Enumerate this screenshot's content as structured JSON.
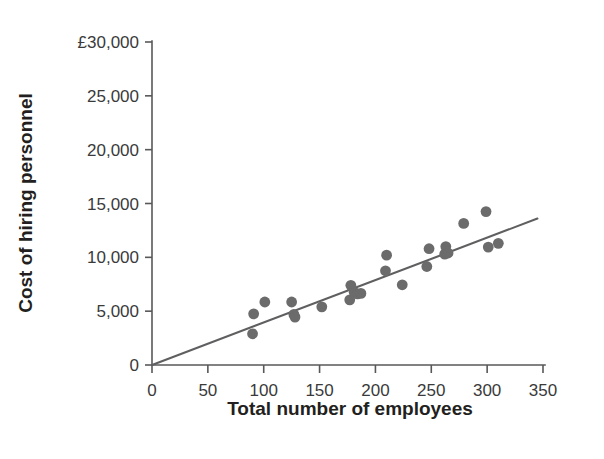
{
  "chart_data": {
    "type": "scatter",
    "title": "",
    "xlabel": "Total number of employees",
    "ylabel": "Cost of hiring personnel",
    "xlim": [
      0,
      350
    ],
    "ylim": [
      0,
      30000
    ],
    "grid": false,
    "legend": null,
    "currency_symbol": "£",
    "x_ticks": [
      0,
      50,
      100,
      150,
      200,
      250,
      300,
      350
    ],
    "x_tick_labels": [
      "0",
      "50",
      "100",
      "150",
      "200",
      "250",
      "300",
      "350"
    ],
    "y_ticks": [
      0,
      5000,
      10000,
      15000,
      20000,
      25000,
      30000
    ],
    "y_tick_labels": [
      "0",
      "5,000",
      "10,000",
      "15,000",
      "20,000",
      "25,000",
      "£30,000"
    ],
    "series": [
      {
        "name": "Cost of hiring personnel",
        "marker": "circle",
        "color": "#6b6b6b",
        "points": [
          [
            90,
            2900
          ],
          [
            91,
            4750
          ],
          [
            101,
            5850
          ],
          [
            125,
            5850
          ],
          [
            127,
            4700
          ],
          [
            128,
            4450
          ],
          [
            152,
            5400
          ],
          [
            177,
            6050
          ],
          [
            178,
            7400
          ],
          [
            181,
            6750
          ],
          [
            184,
            6600
          ],
          [
            187,
            6650
          ],
          [
            209,
            8750
          ],
          [
            210,
            10200
          ],
          [
            224,
            7450
          ],
          [
            246,
            9150
          ],
          [
            248,
            10800
          ],
          [
            262,
            10300
          ],
          [
            263,
            11000
          ],
          [
            265,
            10400
          ],
          [
            279,
            13150
          ],
          [
            299,
            14250
          ],
          [
            301,
            10950
          ],
          [
            310,
            11300
          ]
        ]
      }
    ],
    "trend_line": {
      "name": "line of best fit",
      "color": "#5f5f61",
      "x_start": 0,
      "y_start": 0,
      "x_end": 345,
      "y_end": 13600,
      "slope": 39.4,
      "intercept": 0
    }
  },
  "axes": {
    "x_title": "Total number of employees",
    "y_title": "Cost of hiring personnel"
  }
}
